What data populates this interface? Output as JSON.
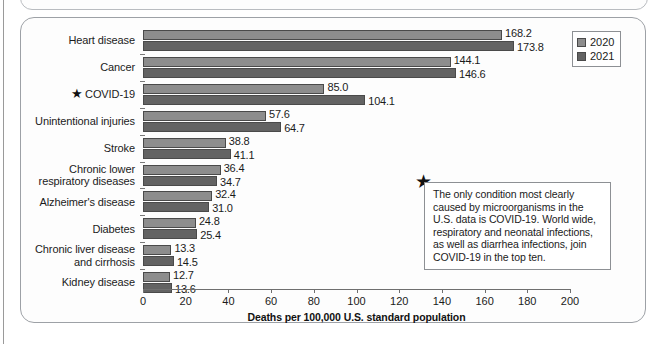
{
  "figure": {
    "axis_title": "Deaths per 100,000 U.S. standard population",
    "legend": [
      {
        "label": "2020",
        "color": "#8d8d8d"
      },
      {
        "label": "2021",
        "color": "#636363"
      }
    ],
    "callout": {
      "star_glyph": "★",
      "text": "The only condition most clearly caused by microorganisms in the U.S. data is COVID-19. World wide, respiratory and neonatal infections, as well as diarrhea infections, join COVID-19 in the top ten."
    },
    "star_glyph": "★"
  },
  "chart_data": {
    "type": "bar",
    "orientation": "horizontal",
    "title": "",
    "xlabel": "Deaths per 100,000 U.S. standard population",
    "ylabel": "",
    "xlim": [
      0,
      200
    ],
    "xticks": [
      0,
      20,
      40,
      60,
      80,
      100,
      120,
      140,
      160,
      180,
      200
    ],
    "grid": false,
    "legend_position": "top-right",
    "categories": [
      "Heart disease",
      "Cancer",
      "COVID-19",
      "Unintentional injuries",
      "Stroke",
      "Chronic lower\nrespiratory diseases",
      "Alzheimer's disease",
      "Diabetes",
      "Chronic liver disease\nand cirrhosis",
      "Kidney disease"
    ],
    "starred_categories": [
      "COVID-19"
    ],
    "series": [
      {
        "name": "2020",
        "color": "#8d8d8d",
        "values": [
          168.2,
          144.1,
          85.0,
          57.6,
          38.8,
          36.4,
          32.4,
          24.8,
          13.3,
          12.7
        ]
      },
      {
        "name": "2021",
        "color": "#636363",
        "values": [
          173.8,
          146.6,
          104.1,
          64.7,
          41.1,
          34.7,
          31.0,
          25.4,
          14.5,
          13.6
        ]
      }
    ]
  }
}
